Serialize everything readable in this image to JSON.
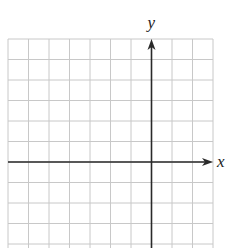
{
  "diagram": {
    "type": "coordinate-grid",
    "x_axis_label": "x",
    "y_axis_label": "y",
    "grid": {
      "columns": 10,
      "rows_visible": 10,
      "cell_size_px": 20.5,
      "left_px": 8,
      "top_px": 39,
      "right_px": 213,
      "bottom_px": 248,
      "line_color": "#c8c8c8"
    },
    "axes": {
      "color": "#2a2a2a",
      "origin_col_from_left": 7,
      "origin_row_from_top": 6,
      "x_axis_arrow": "right",
      "y_axis_arrow": "up"
    }
  }
}
